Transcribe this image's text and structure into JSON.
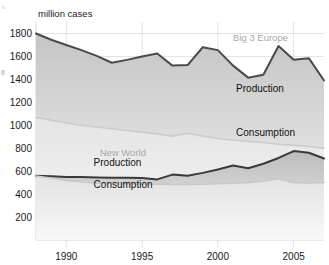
{
  "chart_data": {
    "type": "area",
    "title": "",
    "subtitle": "",
    "xlabel": "",
    "ylabel": "million cases",
    "ylim": [
      0,
      1900
    ],
    "xlim": [
      1988,
      2007
    ],
    "grid": true,
    "legend_position": "inline-annotations",
    "y_ticks": [
      200,
      400,
      600,
      800,
      1000,
      1200,
      1400,
      1600,
      1800
    ],
    "x_ticks": [
      1990,
      1995,
      2000,
      2005
    ],
    "x": [
      1988,
      1989,
      1990,
      1991,
      1992,
      1993,
      1994,
      1995,
      1996,
      1997,
      1998,
      1999,
      2000,
      2001,
      2002,
      2003,
      2004,
      2005,
      2006,
      2007
    ],
    "series": [
      {
        "name": "Big 3 Europe Production",
        "group": "Big 3 Europe",
        "metric": "Production",
        "color": "#4a4a4a",
        "fill": "#d6d6d6",
        "values": [
          1800,
          1745,
          1700,
          1655,
          1605,
          1545,
          1570,
          1600,
          1625,
          1520,
          1525,
          1680,
          1655,
          1520,
          1415,
          1440,
          1690,
          1570,
          1585,
          1390
        ]
      },
      {
        "name": "Big 3 Europe Consumption",
        "group": "Big 3 Europe",
        "metric": "Consumption",
        "color": "#cccccc",
        "fill": "#ececec",
        "values": [
          1070,
          1045,
          1020,
          1000,
          985,
          970,
          955,
          940,
          925,
          905,
          930,
          905,
          885,
          870,
          860,
          850,
          835,
          825,
          815,
          800
        ]
      },
      {
        "name": "New World Production",
        "group": "New World",
        "metric": "Production",
        "color": "#3a3a3a",
        "fill": "#cdcdcd",
        "values": [
          560,
          555,
          550,
          548,
          545,
          543,
          542,
          540,
          528,
          570,
          560,
          585,
          615,
          650,
          625,
          665,
          715,
          775,
          760,
          710
        ]
      },
      {
        "name": "New World Consumption",
        "group": "New World",
        "metric": "Consumption",
        "color": "#c9c9c9",
        "fill": "#efefef",
        "values": [
          558,
          540,
          520,
          505,
          495,
          490,
          488,
          487,
          486,
          485,
          484,
          486,
          490,
          495,
          500,
          512,
          535,
          500,
          498,
          500
        ]
      }
    ],
    "annotations": [
      {
        "id": "big3-europe",
        "text": "Big 3 Europe",
        "style": "gray",
        "x": 2001.0,
        "y": 1735
      },
      {
        "id": "big3-production",
        "text": "Production",
        "style": "dark",
        "x": 2001.2,
        "y": 1290
      },
      {
        "id": "big3-consumption",
        "text": "Consumption",
        "style": "dark",
        "x": 2001.2,
        "y": 905
      },
      {
        "id": "newworld",
        "text": "New World",
        "style": "gray",
        "x": 1992.2,
        "y": 730
      },
      {
        "id": "newworld-production",
        "text": "Production",
        "style": "dark",
        "x": 1991.8,
        "y": 648
      },
      {
        "id": "newworld-consumption",
        "text": "Consumption",
        "style": "dark",
        "x": 1991.8,
        "y": 450
      }
    ]
  },
  "axes": {
    "y_axis_caption": "million cases",
    "y_tick_labels": [
      "1800",
      "1600",
      "1400",
      "1200",
      "1000",
      "800",
      "600",
      "400",
      "200"
    ],
    "x_tick_labels": [
      "1990",
      "1995",
      "2000",
      "2005"
    ]
  },
  "colors": {
    "background": "#ffffff",
    "gridline": "#d9d9d9",
    "axis_text": "#1a1a1a",
    "dark_line": "#4a4a4a",
    "light_line": "#cccccc",
    "gray_label": "#a8a8a8"
  }
}
